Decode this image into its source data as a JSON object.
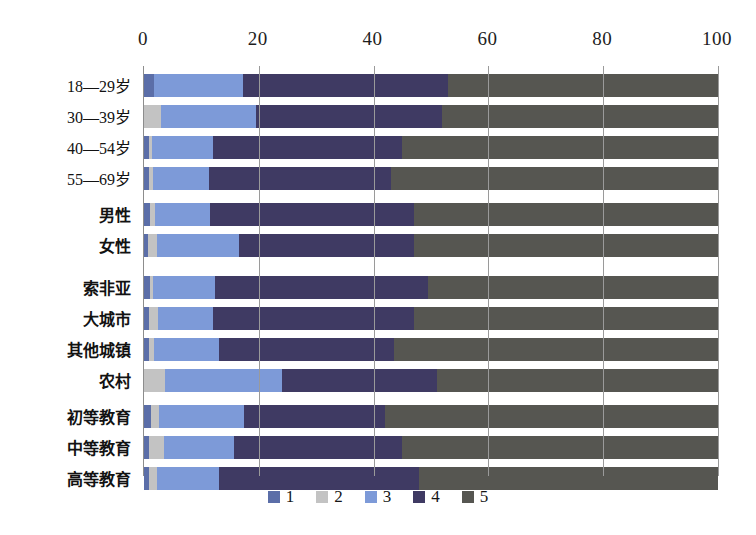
{
  "chart_data": {
    "type": "bar",
    "orientation": "horizontal",
    "stacked": true,
    "normalized_percent": true,
    "title": "",
    "subtitle": "",
    "xlabel": "",
    "ylabel": "",
    "xlim": [
      0,
      100
    ],
    "xticks": [
      0,
      20,
      40,
      60,
      80,
      100
    ],
    "xtick_labels": [
      "0",
      "20",
      "40",
      "60",
      "80",
      "100"
    ],
    "grid": true,
    "grid_axis": "x",
    "legend_position": "bottom",
    "legend": [
      "1",
      "2",
      "3",
      "4",
      "5"
    ],
    "colors": [
      "#5b6ea8",
      "#c3c3c3",
      "#7d9ad8",
      "#3f3a63",
      "#565651"
    ],
    "groups": [
      {
        "name": "age",
        "categories": [
          "18—29岁",
          "30—39岁",
          "40—54岁",
          "55—69岁"
        ]
      },
      {
        "name": "gender",
        "categories": [
          "男性",
          "女性"
        ]
      },
      {
        "name": "settlement",
        "categories": [
          "索非亚",
          "大城市",
          "其他城镇",
          "农村"
        ]
      },
      {
        "name": "education",
        "categories": [
          "初等教育",
          "中等教育",
          "高等教育"
        ]
      }
    ],
    "categories": [
      "18—29岁",
      "30—39岁",
      "40—54岁",
      "55—69岁",
      "男性",
      "女性",
      "索非亚",
      "大城市",
      "其他城镇",
      "农村",
      "初等教育",
      "中等教育",
      "高等教育"
    ],
    "series": [
      {
        "name": "1",
        "values": [
          1.7,
          0.0,
          0.9,
          0.9,
          1.0,
          0.7,
          1.0,
          0.9,
          0.9,
          0.0,
          1.3,
          0.8,
          0.9
        ]
      },
      {
        "name": "2",
        "values": [
          0.0,
          3.0,
          0.5,
          0.6,
          1.0,
          1.6,
          0.6,
          1.6,
          0.9,
          3.7,
          1.3,
          2.6,
          1.3
        ]
      },
      {
        "name": "3",
        "values": [
          15.5,
          16.5,
          10.6,
          9.8,
          9.5,
          14.2,
          10.8,
          9.5,
          11.2,
          20.3,
          14.8,
          12.3,
          10.8
        ]
      },
      {
        "name": "4",
        "values": [
          35.8,
          32.5,
          33.0,
          31.7,
          35.5,
          30.5,
          37.1,
          35.0,
          30.6,
          27.0,
          24.6,
          29.3,
          35.0
        ]
      },
      {
        "name": "5",
        "values": [
          47.0,
          48.0,
          55.0,
          57.0,
          53.0,
          53.0,
          50.5,
          53.0,
          56.4,
          49.0,
          58.0,
          55.0,
          52.0
        ]
      }
    ],
    "row_totals": [
      100,
      100,
      100,
      100,
      100,
      100,
      100,
      100,
      100,
      100,
      100,
      100,
      100
    ]
  },
  "layout": {
    "row_blocks": [
      {
        "start_index": 0,
        "count": 4,
        "top": 8
      },
      {
        "start_index": 4,
        "count": 2,
        "top": 137
      },
      {
        "start_index": 6,
        "count": 4,
        "top": 210
      },
      {
        "start_index": 10,
        "count": 3,
        "top": 339
      }
    ],
    "row_height": 23,
    "row_gap": 8
  },
  "legend_items": [
    {
      "label": "1",
      "color": "#5b6ea8"
    },
    {
      "label": "2",
      "color": "#c3c3c3"
    },
    {
      "label": "3",
      "color": "#7d9ad8"
    },
    {
      "label": "4",
      "color": "#3f3a63"
    },
    {
      "label": "5",
      "color": "#565651"
    }
  ]
}
